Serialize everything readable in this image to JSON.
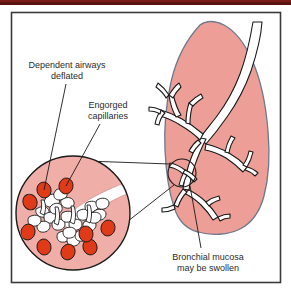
{
  "figure": {
    "frame": {
      "border_color": "#3a3a3a",
      "top_band_color": "#5b1311",
      "background": "#ffffff"
    },
    "colors": {
      "lung_fill": "#ed9e96",
      "lung_outline": "#6b7a8d",
      "inset_fill": "#efafa8",
      "inset_outline": "#1a1a1a",
      "capillary_fill": "#e03a18",
      "capillary_outline": "#1a1a1a",
      "alveoli_fill": "#ffffff",
      "alveoli_outline": "#1a1a1a",
      "airway_fill": "#ffffff",
      "airway_outline": "#1a1a1a",
      "leader_line": "#1a1a1a",
      "label_text": "#2b2b2b"
    },
    "labels": [
      {
        "id": "dependent-airways",
        "line1": "Dependent airways",
        "line2": "deflated",
        "x": 67,
        "y1": 66,
        "y2": 77
      },
      {
        "id": "engorged-capillaries",
        "line1": "Engorged",
        "line2": "capillaries",
        "x": 108,
        "y1": 106,
        "y2": 117
      },
      {
        "id": "bronchial-mucosa",
        "line1": "Bronchial mucosa",
        "line2": "may be swollen",
        "x": 208,
        "y1": 258,
        "y2": 269
      }
    ],
    "parts": {
      "lung": "right-lung-silhouette",
      "bronchial_tree": "bronchial-tree",
      "inset_circle": "magnified-alveoli-inset",
      "source_circle": "magnification-source-marker"
    }
  }
}
